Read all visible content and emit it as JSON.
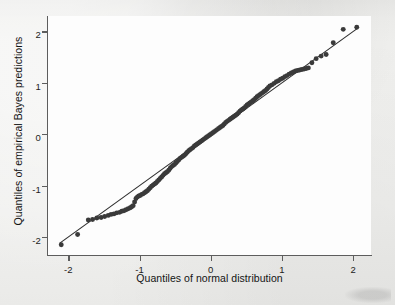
{
  "figure": {
    "background_color": "#ececeb",
    "panel_color": "#fdfdfd",
    "axis_color": "#5d5d5d",
    "marker_color": "#3a3a3a",
    "refline_color": "#2b2b2b"
  },
  "chart_data": {
    "type": "scatter",
    "title": "",
    "subtitle": "",
    "xlabel": "Quantiles of normal distribution",
    "ylabel": "Quantiles of empirical Bayes predictions",
    "xlim": [
      -2.3,
      2.25
    ],
    "ylim": [
      -2.35,
      2.3
    ],
    "xticks": [
      -2,
      -1,
      0,
      1,
      2
    ],
    "xticklabels": [
      "-2",
      "-1",
      "0",
      "1",
      "2"
    ],
    "yticks": [
      -2,
      -1,
      0,
      1,
      2
    ],
    "yticklabels": [
      "-2",
      "-1",
      "0",
      "1",
      "2"
    ],
    "grid": false,
    "legend": "none",
    "annotations": [],
    "series": [
      {
        "name": "Reference line (45 degrees)",
        "type": "line",
        "x": [
          -2.12,
          2.06
        ],
        "y": [
          -2.12,
          2.06
        ]
      },
      {
        "name": "Empirical Bayes predictions vs normal quantiles",
        "type": "scatter",
        "marker": "filled-circle",
        "x": [
          -2.1,
          -1.87,
          -1.72,
          -1.66,
          -1.6,
          -1.54,
          -1.49,
          -1.44,
          -1.4,
          -1.36,
          -1.32,
          -1.28,
          -1.25,
          -1.22,
          -1.19,
          -1.16,
          -1.13,
          -1.11,
          -1.09,
          -1.07,
          -1.05,
          -1.03,
          -1.01,
          -0.99,
          -0.97,
          -0.95,
          -0.93,
          -0.91,
          -0.89,
          -0.87,
          -0.85,
          -0.83,
          -0.81,
          -0.79,
          -0.77,
          -0.75,
          -0.73,
          -0.71,
          -0.69,
          -0.67,
          -0.65,
          -0.63,
          -0.61,
          -0.59,
          -0.57,
          -0.55,
          -0.53,
          -0.51,
          -0.49,
          -0.47,
          -0.45,
          -0.43,
          -0.41,
          -0.39,
          -0.37,
          -0.35,
          -0.33,
          -0.31,
          -0.29,
          -0.27,
          -0.25,
          -0.23,
          -0.21,
          -0.19,
          -0.17,
          -0.15,
          -0.13,
          -0.11,
          -0.09,
          -0.07,
          -0.05,
          -0.03,
          -0.01,
          0.01,
          0.03,
          0.05,
          0.07,
          0.09,
          0.11,
          0.13,
          0.15,
          0.17,
          0.19,
          0.21,
          0.23,
          0.25,
          0.27,
          0.29,
          0.31,
          0.33,
          0.35,
          0.37,
          0.39,
          0.41,
          0.43,
          0.45,
          0.47,
          0.49,
          0.51,
          0.53,
          0.55,
          0.57,
          0.59,
          0.61,
          0.63,
          0.65,
          0.67,
          0.69,
          0.71,
          0.73,
          0.75,
          0.77,
          0.79,
          0.81,
          0.83,
          0.86,
          0.89,
          0.92,
          0.95,
          0.98,
          1.01,
          1.04,
          1.07,
          1.1,
          1.13,
          1.16,
          1.19,
          1.22,
          1.25,
          1.28,
          1.31,
          1.34,
          1.37,
          1.42,
          1.48,
          1.55,
          1.62,
          1.72,
          1.86,
          2.05
        ],
        "y": [
          -2.15,
          -1.95,
          -1.67,
          -1.66,
          -1.63,
          -1.62,
          -1.6,
          -1.58,
          -1.56,
          -1.55,
          -1.53,
          -1.52,
          -1.5,
          -1.49,
          -1.47,
          -1.45,
          -1.43,
          -1.41,
          -1.39,
          -1.32,
          -1.25,
          -1.22,
          -1.2,
          -1.19,
          -1.17,
          -1.16,
          -1.14,
          -1.12,
          -1.1,
          -1.07,
          -1.04,
          -1.01,
          -0.99,
          -0.97,
          -0.95,
          -0.92,
          -0.89,
          -0.86,
          -0.83,
          -0.8,
          -0.77,
          -0.75,
          -0.73,
          -0.7,
          -0.66,
          -0.63,
          -0.61,
          -0.59,
          -0.56,
          -0.53,
          -0.5,
          -0.47,
          -0.45,
          -0.43,
          -0.41,
          -0.38,
          -0.35,
          -0.32,
          -0.3,
          -0.28,
          -0.26,
          -0.23,
          -0.21,
          -0.19,
          -0.17,
          -0.15,
          -0.13,
          -0.11,
          -0.09,
          -0.07,
          -0.05,
          -0.03,
          -0.01,
          0.01,
          0.03,
          0.05,
          0.07,
          0.09,
          0.11,
          0.13,
          0.15,
          0.17,
          0.2,
          0.23,
          0.25,
          0.27,
          0.29,
          0.31,
          0.33,
          0.35,
          0.37,
          0.39,
          0.42,
          0.45,
          0.47,
          0.49,
          0.51,
          0.54,
          0.57,
          0.59,
          0.61,
          0.63,
          0.65,
          0.67,
          0.7,
          0.73,
          0.75,
          0.77,
          0.79,
          0.81,
          0.83,
          0.85,
          0.88,
          0.91,
          0.94,
          0.96,
          0.99,
          1.02,
          1.04,
          1.07,
          1.09,
          1.12,
          1.14,
          1.17,
          1.19,
          1.21,
          1.23,
          1.24,
          1.25,
          1.26,
          1.27,
          1.28,
          1.29,
          1.39,
          1.47,
          1.52,
          1.55,
          1.78,
          2.04,
          2.08
        ]
      }
    ]
  }
}
